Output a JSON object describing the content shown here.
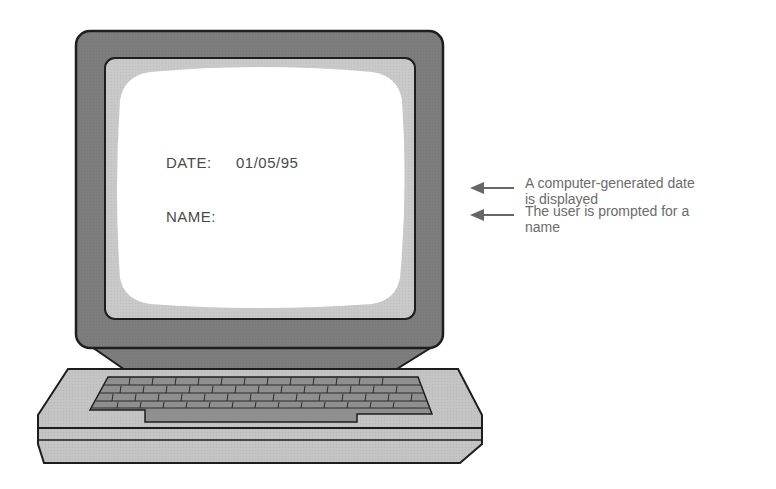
{
  "figure": {
    "type": "illustration",
    "colors": {
      "bezel": "#7d7d7d",
      "screen_surround": "#c9c9c9",
      "screen": "#ffffff",
      "keyboard_body": "#c4c4c4",
      "keyboard_keys": "#8f8f8f",
      "outline": "#1e1e1e",
      "text": "#4a4a4a",
      "callout_text": "#6b6b6b",
      "arrow": "#666666"
    }
  },
  "screen": {
    "date_label": "DATE:",
    "date_value": "01/05/95",
    "name_label": "NAME:"
  },
  "callouts": [
    {
      "line1": "A computer-generated date",
      "line2": "is displayed"
    },
    {
      "line1": "The user is prompted for a",
      "line2": "name"
    }
  ]
}
